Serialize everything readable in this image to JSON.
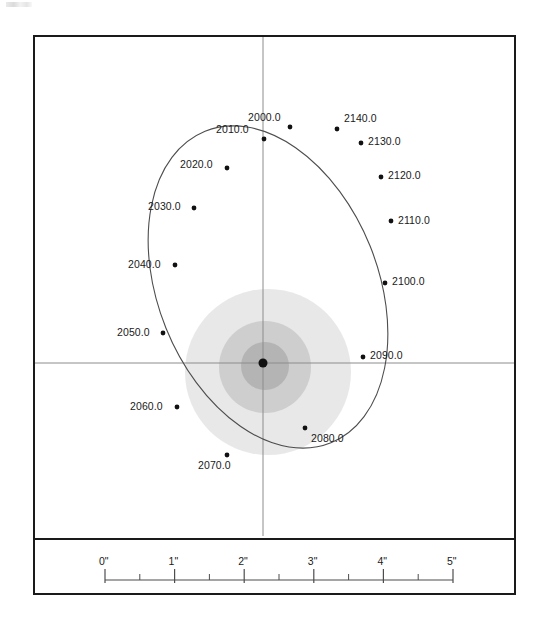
{
  "figure": {
    "type": "orbit-plot",
    "frame": {
      "x": 33,
      "y": 35,
      "width": 483,
      "height": 560
    },
    "panel_divider_y": 538
  },
  "chart_data": {
    "type": "scatter",
    "title": "",
    "xlabel": "",
    "ylabel": "",
    "grid": false,
    "legend": null,
    "axes": {
      "origin_px": [
        263,
        363
      ],
      "vertical_line": {
        "x": 263,
        "y1": 37,
        "y2": 536
      },
      "horizontal_line": {
        "y": 363,
        "x1": 35,
        "x2": 514
      },
      "color": "#8c8c8c"
    },
    "orbit": {
      "shape": "ellipse",
      "center_px": [
        268,
        287
      ],
      "semi_major_px": 168,
      "semi_minor_px": 110,
      "rotation_deg": -22,
      "stroke": "#4d4d4d"
    },
    "primary_star": {
      "label": "",
      "position_px": [
        263,
        363
      ],
      "marker": "filled-circle",
      "radius_px": 4.5,
      "color": "#111111"
    },
    "halo": [
      {
        "cx": 268,
        "cy": 372,
        "r": 83,
        "fill": "#d6d6d6",
        "opacity": 0.55
      },
      {
        "cx": 265,
        "cy": 367,
        "r": 46,
        "fill": "#bdbdbd",
        "opacity": 0.6
      },
      {
        "cx": 265,
        "cy": 366,
        "r": 24,
        "fill": "#a6a6a6",
        "opacity": 0.65
      }
    ],
    "epoch_unit": "year",
    "epoch_step": 10,
    "points": [
      {
        "label": "2000.0",
        "px": 290,
        "py": 127,
        "lx": 248,
        "ly": 112,
        "anchor": "left"
      },
      {
        "label": "2010.0",
        "px": 264,
        "py": 139,
        "lx": 216,
        "ly": 124,
        "anchor": "left"
      },
      {
        "label": "2020.0",
        "px": 227,
        "py": 168,
        "lx": 180,
        "ly": 159,
        "anchor": "left"
      },
      {
        "label": "2030.0",
        "px": 194,
        "py": 208,
        "lx": 148,
        "ly": 201,
        "anchor": "left"
      },
      {
        "label": "2040.0",
        "px": 175,
        "py": 265,
        "lx": 128,
        "ly": 259,
        "anchor": "left"
      },
      {
        "label": "2050.0",
        "px": 163,
        "py": 333,
        "lx": 117,
        "ly": 327,
        "anchor": "left"
      },
      {
        "label": "2060.0",
        "px": 177,
        "py": 407,
        "lx": 130,
        "ly": 401,
        "anchor": "left"
      },
      {
        "label": "2070.0",
        "px": 227,
        "py": 455,
        "lx": 198,
        "ly": 460,
        "anchor": "left"
      },
      {
        "label": "2080.0",
        "px": 305,
        "py": 428,
        "lx": 311,
        "ly": 433,
        "anchor": "left"
      },
      {
        "label": "2090.0",
        "px": 363,
        "py": 357,
        "lx": 370,
        "ly": 350,
        "anchor": "left"
      },
      {
        "label": "2100.0",
        "px": 385,
        "py": 283,
        "lx": 392,
        "ly": 276,
        "anchor": "left"
      },
      {
        "label": "2110.0",
        "px": 391,
        "py": 221,
        "lx": 398,
        "ly": 215,
        "anchor": "left"
      },
      {
        "label": "2120.0",
        "px": 381,
        "py": 177,
        "lx": 388,
        "ly": 170,
        "anchor": "left"
      },
      {
        "label": "2130.0",
        "px": 361,
        "py": 143,
        "lx": 368,
        "ly": 136,
        "anchor": "left"
      },
      {
        "label": "2140.0",
        "px": 337,
        "py": 129,
        "lx": 344,
        "ly": 113,
        "anchor": "left"
      }
    ]
  },
  "scale_bar": {
    "unit_symbol": "\"",
    "x_start": 105,
    "x_end": 453,
    "axis_y": 580,
    "px_per_unit": 69.6,
    "major_ticks": [
      {
        "value": 0,
        "label": "0\""
      },
      {
        "value": 1,
        "label": "1\""
      },
      {
        "value": 2,
        "label": "2\""
      },
      {
        "value": 3,
        "label": "3\""
      },
      {
        "value": 4,
        "label": "4\""
      },
      {
        "value": 5,
        "label": "5\""
      }
    ],
    "minor_ticks": [
      0.5,
      1.5,
      2.5,
      3.5,
      4.5
    ],
    "label_y": 556,
    "color": "#4d4d4d"
  }
}
